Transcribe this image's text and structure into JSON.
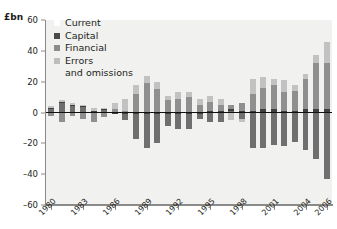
{
  "axis": {
    "y_unit_label": "£bn",
    "y_ticks": [
      60,
      40,
      20,
      0,
      -20,
      -40,
      -60
    ],
    "y_min": -60,
    "y_max": 60,
    "x_ticks": [
      "1980",
      "1983",
      "1986",
      "1989",
      "1992",
      "1995",
      "1998",
      "2001",
      "2004",
      "2006"
    ]
  },
  "legend": {
    "items": [
      {
        "label": "Current",
        "color": "#ffffff"
      },
      {
        "label": "Capital",
        "color": "#4a4a4a"
      },
      {
        "label": "Financial",
        "color": "#8c8c8c"
      },
      {
        "label": "Errors",
        "color": "#bdbdbd"
      }
    ],
    "continuation_label": "and omissions"
  },
  "colors": {
    "current": "#6f6f6f",
    "capital": "#3f3f3f",
    "financial": "#8f8f8f",
    "errors": "#c2c2c2",
    "plot_background": "#f1f1ef",
    "axis": "#8a8a8a",
    "zero_line": "#111111",
    "text": "#231f20"
  },
  "chart_data": {
    "type": "bar",
    "title": "",
    "subtitle": "",
    "xlabel": "",
    "ylabel": "£bn",
    "ylim": [
      -60,
      60
    ],
    "grid": false,
    "legend_position": "top-left",
    "stacked": true,
    "categories": [
      "1980",
      "1981",
      "1982",
      "1983",
      "1984",
      "1985",
      "1986",
      "1987",
      "1988",
      "1989",
      "1990",
      "1991",
      "1992",
      "1993",
      "1994",
      "1995",
      "1996",
      "1997",
      "1998",
      "1999",
      "2000",
      "2001",
      "2002",
      "2003",
      "2004",
      "2005",
      "2006"
    ],
    "series": [
      {
        "name": "Current",
        "color": "#6f6f6f",
        "values": [
          3,
          7,
          5,
          4,
          1,
          2,
          -1,
          -5,
          -17,
          -23,
          -20,
          -9,
          -11,
          -11,
          -4,
          -6,
          -6,
          1,
          -4,
          -23,
          -23,
          -21,
          -22,
          -19,
          -24,
          -30,
          -43
        ]
      },
      {
        "name": "Capital",
        "color": "#3f3f3f",
        "values": [
          0,
          0,
          0,
          0,
          0,
          0,
          0,
          0,
          0,
          0,
          0,
          0,
          0,
          0,
          0,
          1,
          1,
          1,
          1,
          1,
          2,
          2,
          1,
          1,
          2,
          2,
          2
        ]
      },
      {
        "name": "Financial",
        "color": "#8f8f8f",
        "values": [
          -2,
          -6,
          -2,
          -4,
          -6,
          -3,
          2,
          1,
          12,
          19,
          15,
          8,
          9,
          10,
          5,
          6,
          4,
          3,
          5,
          11,
          14,
          16,
          12,
          13,
          20,
          30,
          30
        ]
      },
      {
        "name": "Errors and omissions",
        "color": "#c2c2c2",
        "values": [
          1,
          1,
          1,
          1,
          2,
          1,
          4,
          8,
          6,
          5,
          5,
          3,
          4,
          3,
          4,
          4,
          4,
          -5,
          -2,
          10,
          7,
          4,
          8,
          4,
          3,
          5,
          14
        ]
      }
    ]
  }
}
